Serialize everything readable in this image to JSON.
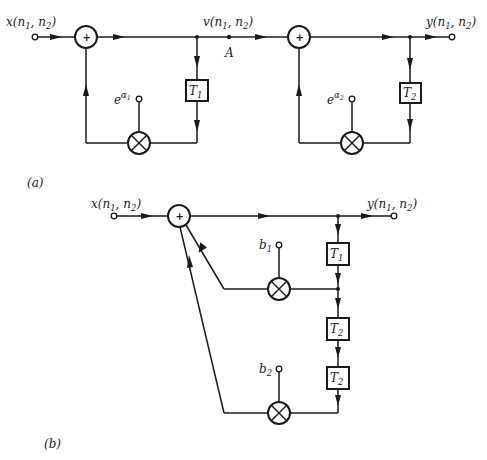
{
  "figure_a": {
    "caption": "(a)",
    "input_label": "x(n",
    "input_sub1": "1",
    "input_mid": ", n",
    "input_sub2": "2",
    "input_close": ")",
    "mid_label": "v(n",
    "mid_sub1": "1",
    "mid_mid": ", n",
    "mid_sub2": "2",
    "mid_close": ")",
    "point_label": "A",
    "output_label": "y(n",
    "output_sub1": "1",
    "output_mid": ", n",
    "output_sub2": "2",
    "output_close": ")",
    "adder_symbol": "+",
    "stage1": {
      "delay": "T",
      "delay_sub": "1",
      "coef": "e",
      "coef_sup": "α",
      "coef_sup_sub": "1"
    },
    "stage2": {
      "delay": "T",
      "delay_sub": "2",
      "coef": "e",
      "coef_sup": "α",
      "coef_sup_sub": "2"
    }
  },
  "figure_b": {
    "caption": "(b)",
    "input_label": "x(n",
    "input_sub1": "1",
    "input_mid": ", n",
    "input_sub2": "2",
    "input_close": ")",
    "output_label": "y(n",
    "output_sub1": "1",
    "output_mid": ", n",
    "output_sub2": "2",
    "output_close": ")",
    "adder_symbol": "+",
    "delays": [
      {
        "label": "T",
        "sub": "1"
      },
      {
        "label": "T",
        "sub": "2"
      },
      {
        "label": "T",
        "sub": "2"
      }
    ],
    "coefs": [
      {
        "label": "b",
        "sub": "1"
      },
      {
        "label": "b",
        "sub": "2"
      }
    ]
  }
}
